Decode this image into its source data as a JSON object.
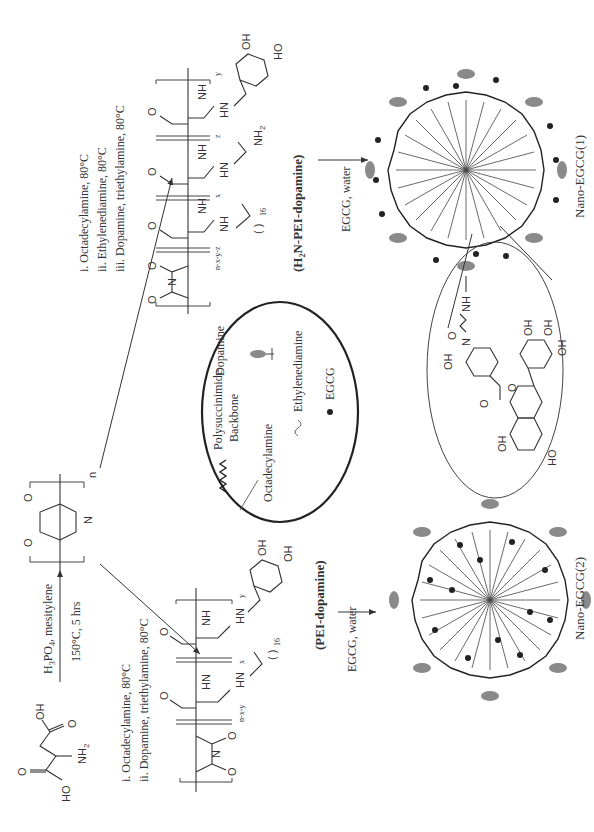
{
  "diagram": {
    "orientation": "rotated -90deg (text reads bottom-to-top)",
    "start_material": {
      "name": "aspartic acid",
      "labels": [
        "HO",
        "O",
        "NH2",
        "OH",
        "O"
      ]
    },
    "step1": {
      "reagent": "H3PO4, mesitylene",
      "conditions": "150°C, 5 hrs",
      "product_labels": [
        "O",
        "N",
        "O",
        "n"
      ]
    },
    "route_left": {
      "conditions": [
        "i. Octadecylamine, 80°C",
        "ii. Dopamine, triethylamine, 80°C"
      ],
      "subscripts": [
        "n-x-y",
        "x",
        "y",
        "16"
      ],
      "polymer_name": "(PEI-dopamine)",
      "final_step": "EGCG, water",
      "product": "Nano-EGCG(2)"
    },
    "route_right": {
      "conditions": [
        "i. Octadecylamine, 80°C",
        "ii. Ethylenediamine, 80°C",
        "iii. Dopamine, triethylamine, 80°C"
      ],
      "subscripts": [
        "n-x-y-z",
        "x",
        "z",
        "y",
        "16"
      ],
      "polymer_name": "(H2N-PEI-dopamine)",
      "final_step": "EGCG, water",
      "product": "Nano-EGCG(1)"
    },
    "legend": {
      "items": [
        {
          "symbol": "wavy-thick",
          "label": "Polysuccinimide Backbone",
          "line1": "Polysuccinimide",
          "line2": "Backbone"
        },
        {
          "symbol": "ellipse-gray",
          "label": "Dopamine"
        },
        {
          "symbol": "thin-line",
          "label": "Octadecylamine"
        },
        {
          "symbol": "tilde",
          "label": "Ethylenediamine"
        },
        {
          "symbol": "dot",
          "label": "EGCG"
        }
      ]
    },
    "inset": {
      "description": "EGCG conjugated via ethylenediamine linker",
      "labels": [
        "NH",
        "N",
        "OH",
        "O",
        "OH",
        "OH",
        "OH",
        "O",
        "O",
        "OH",
        "HO"
      ]
    },
    "colors": {
      "ink": "#333333",
      "dopamine_gray": "#8a8a8a",
      "egcg_dot": "#222222",
      "background": "#ffffff"
    }
  }
}
